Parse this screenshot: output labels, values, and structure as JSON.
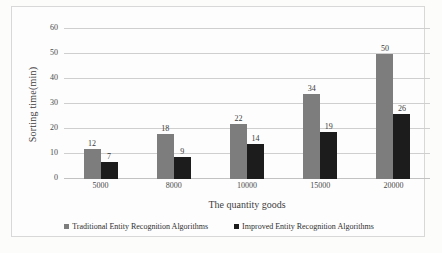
{
  "chart_data": {
    "type": "bar",
    "title": "",
    "xlabel": "The quantity goods",
    "ylabel": "Sorting time(min)",
    "categories": [
      "5000",
      "8000",
      "10000",
      "15000",
      "20000"
    ],
    "series": [
      {
        "name": "Traditional Entity Recognition Algorithms",
        "color": "#7d7d7d",
        "values": [
          12,
          18,
          22,
          34,
          50
        ]
      },
      {
        "name": "Improved Entity Recognition Algorithms",
        "color": "#1c1c1c",
        "values": [
          7,
          9,
          14,
          19,
          26
        ]
      }
    ],
    "ylim": [
      0,
      60
    ],
    "yticks": [
      0,
      10,
      20,
      30,
      40,
      50,
      60
    ],
    "grid": true,
    "legend_position": "bottom"
  }
}
